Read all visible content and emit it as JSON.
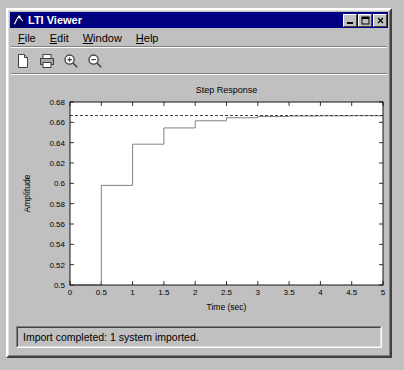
{
  "window": {
    "title": "LTI Viewer",
    "icon": "matlab-membrane-icon",
    "buttons": {
      "minimize_label": "_",
      "maximize_label": "□",
      "close_label": "×"
    }
  },
  "menubar": {
    "items": [
      {
        "label": "File",
        "mnemonic": "F",
        "name": "menu-file"
      },
      {
        "label": "Edit",
        "mnemonic": "E",
        "name": "menu-edit"
      },
      {
        "label": "Window",
        "mnemonic": "W",
        "name": "menu-window"
      },
      {
        "label": "Help",
        "mnemonic": "H",
        "name": "menu-help"
      }
    ]
  },
  "toolbar": {
    "buttons": [
      {
        "icon": "new-document-icon",
        "name": "new-document-button"
      },
      {
        "icon": "print-icon",
        "name": "print-button"
      },
      {
        "icon": "zoom-in-icon",
        "name": "zoom-in-button"
      },
      {
        "icon": "zoom-out-icon",
        "name": "zoom-out-button"
      }
    ]
  },
  "statusbar": {
    "message": "Import completed: 1 system imported."
  },
  "chart_data": {
    "type": "line",
    "title": "Step Response",
    "xlabel": "Time (sec)",
    "ylabel": "Amplitude",
    "xlim": [
      0,
      5
    ],
    "ylim": [
      0.5,
      0.68
    ],
    "xticks": [
      0,
      0.5,
      1,
      1.5,
      2,
      2.5,
      3,
      3.5,
      4,
      4.5,
      5
    ],
    "xticklabels": [
      "0",
      "0.5",
      "1",
      "1.5",
      "2",
      "2.5",
      "3",
      "3.5",
      "4",
      "4.5",
      "5"
    ],
    "yticks": [
      0.5,
      0.52,
      0.54,
      0.56,
      0.58,
      0.6,
      0.62,
      0.64,
      0.66,
      0.68
    ],
    "yticklabels": [
      "0.5",
      "0.52",
      "0.54",
      "0.56",
      "0.58",
      "0.6",
      "0.62",
      "0.64",
      "0.66",
      "0.68"
    ],
    "grid": false,
    "legend": null,
    "line_color": "#808080",
    "asymptote_color": "#404040",
    "series": [
      {
        "name": "step-response-staircase",
        "style": "stairs",
        "x": [
          0,
          0.5,
          0.5,
          1.0,
          1.0,
          1.5,
          1.5,
          2.0,
          2.0,
          2.5,
          2.5,
          3.0,
          3.0,
          3.5,
          3.5,
          4.0,
          4.0,
          4.5,
          4.5,
          5.0
        ],
        "y": [
          0.5,
          0.5,
          0.598,
          0.598,
          0.6385,
          0.6385,
          0.6545,
          0.6545,
          0.6615,
          0.6615,
          0.6645,
          0.6645,
          0.6657,
          0.6657,
          0.6662,
          0.6662,
          0.6664,
          0.6664,
          0.6665,
          0.6665
        ]
      },
      {
        "name": "steady-state-asymptote",
        "style": "dashed",
        "x": [
          0,
          5
        ],
        "y": [
          0.6667,
          0.6667
        ]
      }
    ],
    "annotations": []
  }
}
